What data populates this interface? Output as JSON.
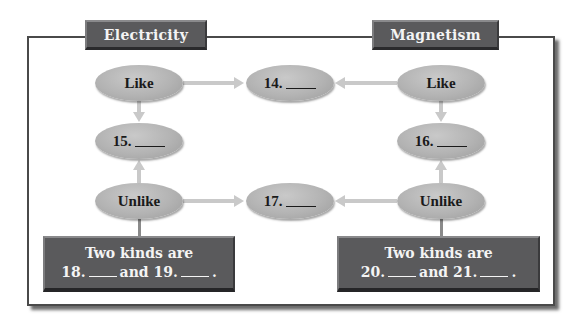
{
  "headers": {
    "left": "Electricity",
    "right": "Magnetism"
  },
  "nodes": {
    "like_left": "Like",
    "like_right": "Like",
    "unlike_left": "Unlike",
    "unlike_right": "Unlike",
    "q14": "14.",
    "q15": "15.",
    "q16": "16.",
    "q17": "17."
  },
  "boxes": {
    "left": {
      "line1": "Two kinds are",
      "num_a": "18.",
      "joiner": "and",
      "num_b": "19.",
      "end": "."
    },
    "right": {
      "line1": "Two kinds are",
      "num_a": "20.",
      "joiner": "and",
      "num_b": "21.",
      "end": "."
    }
  },
  "colors": {
    "header_bg": "#5a5a5c",
    "oval_fill": "#b3b3b3",
    "arrow": "#c9c9c9",
    "frame": "#4a4a4a"
  }
}
